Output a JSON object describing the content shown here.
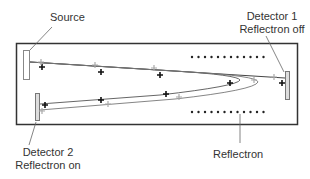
{
  "labels": {
    "source": "Source",
    "detector1_line1": "Detector 1",
    "detector1_line2": "Reflectron off",
    "detector2_line1": "Detector 2",
    "detector2_line2": "Reflectron on",
    "reflectron": "Reflectron"
  },
  "colors": {
    "outline": "#333333",
    "ion_dark": "#111111",
    "ion_light": "#a8a8a8",
    "detector_fill": "#ffffff",
    "detector_gray": "#bbbbbb"
  },
  "diagram": {
    "components": [
      "Source",
      "Detector 1 (Reflectron off)",
      "Detector 2 (Reflectron on)",
      "Reflectron"
    ],
    "dots_per_row": 12
  }
}
